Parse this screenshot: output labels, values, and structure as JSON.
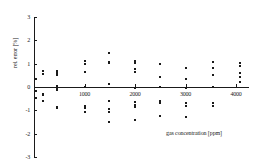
{
  "chart_data": {
    "type": "scatter",
    "title": "",
    "xlabel": "gas concentration [ppm]",
    "ylabel": "rel. error [%]",
    "xlim": [
      0,
      4200
    ],
    "ylim": [
      -3,
      3
    ],
    "grid": false,
    "legend": null,
    "xticks": [
      1000,
      2000,
      3000,
      4000
    ],
    "xtick_labels": [
      "1000",
      "2000",
      "3000",
      "4000"
    ],
    "yticks": [
      3,
      2,
      1,
      0,
      -1,
      -2,
      -3
    ],
    "ytick_labels": [
      "3",
      "2",
      "1",
      "0",
      "-1",
      "-2",
      "-3"
    ],
    "marker": "square",
    "marker_color": "#1a1a1a",
    "zero_line": 0,
    "series": [
      {
        "name": "rel. error",
        "points": [
          {
            "x": 30,
            "y": 0.35
          },
          {
            "x": 30,
            "y": -0.45
          },
          {
            "x": 30,
            "y": -0.15
          },
          {
            "x": 180,
            "y": 0.7
          },
          {
            "x": 180,
            "y": 0.55
          },
          {
            "x": 180,
            "y": -0.3
          },
          {
            "x": 180,
            "y": -0.35
          },
          {
            "x": 180,
            "y": -0.6
          },
          {
            "x": 450,
            "y": 0.68
          },
          {
            "x": 450,
            "y": 0.6
          },
          {
            "x": 450,
            "y": 0.52
          },
          {
            "x": 450,
            "y": 0.05
          },
          {
            "x": 450,
            "y": -0.08
          },
          {
            "x": 450,
            "y": -0.12
          },
          {
            "x": 450,
            "y": -0.85
          },
          {
            "x": 450,
            "y": -0.92
          },
          {
            "x": 1000,
            "y": 1.1
          },
          {
            "x": 1000,
            "y": 1.0
          },
          {
            "x": 1000,
            "y": 0.65
          },
          {
            "x": 1000,
            "y": -0.02
          },
          {
            "x": 1000,
            "y": -0.8
          },
          {
            "x": 1000,
            "y": -0.92
          },
          {
            "x": 1000,
            "y": -1.05
          },
          {
            "x": 1480,
            "y": 1.45
          },
          {
            "x": 1480,
            "y": 1.08
          },
          {
            "x": 1480,
            "y": 1.02
          },
          {
            "x": 1480,
            "y": 0.12
          },
          {
            "x": 1480,
            "y": -0.62
          },
          {
            "x": 1480,
            "y": -0.95
          },
          {
            "x": 1480,
            "y": -1.08
          },
          {
            "x": 1480,
            "y": -1.52
          },
          {
            "x": 2000,
            "y": 1.12
          },
          {
            "x": 2000,
            "y": 1.02
          },
          {
            "x": 2000,
            "y": 0.78
          },
          {
            "x": 2000,
            "y": 0.65
          },
          {
            "x": 2000,
            "y": -0.05
          },
          {
            "x": 2000,
            "y": -0.65
          },
          {
            "x": 2000,
            "y": -0.75
          },
          {
            "x": 2000,
            "y": -0.85
          },
          {
            "x": 2000,
            "y": -1.42
          },
          {
            "x": 2500,
            "y": 1.0
          },
          {
            "x": 2500,
            "y": 0.45
          },
          {
            "x": 2500,
            "y": -0.02
          },
          {
            "x": 2500,
            "y": -0.58
          },
          {
            "x": 2500,
            "y": -0.7
          },
          {
            "x": 2500,
            "y": -1.25
          },
          {
            "x": 3000,
            "y": 0.82
          },
          {
            "x": 3000,
            "y": 0.35
          },
          {
            "x": 3000,
            "y": -0.05
          },
          {
            "x": 3000,
            "y": -0.68
          },
          {
            "x": 3000,
            "y": -0.8
          },
          {
            "x": 3000,
            "y": -1.28
          },
          {
            "x": 3550,
            "y": 1.08
          },
          {
            "x": 3550,
            "y": 0.82
          },
          {
            "x": 3550,
            "y": 0.52
          },
          {
            "x": 3550,
            "y": 0.02
          },
          {
            "x": 3550,
            "y": -0.7
          },
          {
            "x": 3550,
            "y": -0.8
          },
          {
            "x": 4080,
            "y": 1.02
          },
          {
            "x": 4080,
            "y": 0.9
          },
          {
            "x": 4080,
            "y": 0.62
          },
          {
            "x": 4080,
            "y": 0.42
          },
          {
            "x": 4080,
            "y": 0.22
          }
        ]
      }
    ]
  }
}
